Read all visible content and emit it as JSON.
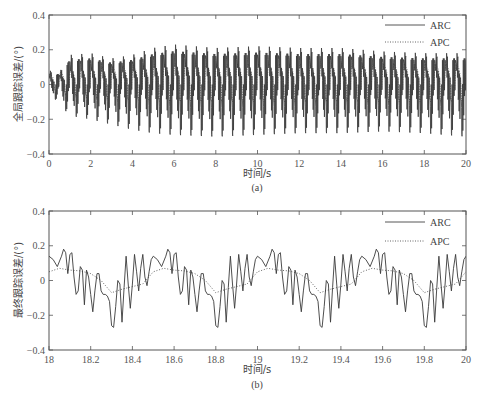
{
  "chart_data": [
    {
      "id": "a",
      "type": "line",
      "caption": "(a)",
      "ylabel": "全局跟踪误差/(°)",
      "xlabel": "时间/s",
      "xlim": [
        0,
        20
      ],
      "ylim": [
        -0.4,
        0.4
      ],
      "xticks": [
        0,
        2,
        4,
        6,
        8,
        10,
        12,
        14,
        16,
        18,
        20
      ],
      "xtick_labels": [
        "0",
        "2",
        "4",
        "6",
        "8",
        "10",
        "12",
        "14",
        "16",
        "18",
        "20"
      ],
      "yticks": [
        -0.4,
        -0.2,
        0,
        0.2,
        0.4
      ],
      "ytick_labels": [
        "-0.4",
        "-0.2",
        "0",
        "0.2",
        "0.4"
      ],
      "grid": false,
      "legend": {
        "position": "upper right",
        "entries": [
          {
            "name": "ARC",
            "style": "solid"
          },
          {
            "name": "APC",
            "style": "dotted"
          }
        ]
      },
      "series": [
        {
          "name": "ARC",
          "style": "solid",
          "description": "Dense oscillation, period ~0.5 s, each cycle containing high-frequency ripple",
          "period_s": 0.5,
          "envelope": {
            "t": [
              0,
              0.5,
              1,
              2,
              3,
              4,
              5,
              6,
              8,
              10,
              12,
              14,
              16,
              18,
              20
            ],
            "max": [
              0.08,
              0.07,
              0.17,
              0.18,
              0.15,
              0.17,
              0.21,
              0.23,
              0.21,
              0.22,
              0.21,
              0.21,
              0.19,
              0.18,
              0.18
            ],
            "min": [
              -0.05,
              -0.11,
              -0.18,
              -0.2,
              -0.23,
              -0.26,
              -0.28,
              -0.29,
              -0.3,
              -0.29,
              -0.28,
              -0.28,
              -0.27,
              -0.28,
              -0.3
            ]
          }
        },
        {
          "name": "APC",
          "style": "dotted",
          "description": "Smoother oscillation with same period, amplitude ~0.1",
          "period_s": 0.5,
          "envelope": {
            "t": [
              0,
              2,
              6,
              10,
              20
            ],
            "max": [
              0.06,
              0.1,
              0.12,
              0.12,
              0.12
            ],
            "min": [
              -0.05,
              -0.08,
              -0.1,
              -0.1,
              -0.1
            ]
          }
        }
      ]
    },
    {
      "id": "b",
      "type": "line",
      "caption": "(b)",
      "ylabel": "最终跟踪误差/(°)",
      "xlabel": "时间/s",
      "xlim": [
        18,
        20
      ],
      "ylim": [
        -0.4,
        0.4
      ],
      "xticks": [
        18,
        18.2,
        18.4,
        18.6,
        18.8,
        19,
        19.2,
        19.4,
        19.6,
        19.8,
        20
      ],
      "xtick_labels": [
        "18",
        "18.2",
        "18.4",
        "18.6",
        "18.8",
        "19",
        "19.2",
        "19.4",
        "19.6",
        "19.8",
        "20"
      ],
      "yticks": [
        -0.4,
        -0.2,
        0,
        0.2,
        0.4
      ],
      "ytick_labels": [
        "-0.4",
        "-0.2",
        "0",
        "0.2",
        "0.4"
      ],
      "grid": false,
      "legend": {
        "position": "upper right",
        "entries": [
          {
            "name": "ARC",
            "style": "solid"
          },
          {
            "name": "APC",
            "style": "dotted"
          }
        ]
      },
      "period_s": 0.5,
      "series": [
        {
          "name": "ARC",
          "style": "solid",
          "cycle_t_offset": [
            0,
            0.02,
            0.04,
            0.06,
            0.07,
            0.08,
            0.09,
            0.1,
            0.11,
            0.12,
            0.13,
            0.14,
            0.15,
            0.16,
            0.17,
            0.18,
            0.19,
            0.2,
            0.21,
            0.22,
            0.23,
            0.24,
            0.25,
            0.26,
            0.27,
            0.28,
            0.29,
            0.3,
            0.31,
            0.32,
            0.33,
            0.34,
            0.35,
            0.36,
            0.37,
            0.38,
            0.39,
            0.4,
            0.41,
            0.42,
            0.43,
            0.44,
            0.45,
            0.46,
            0.47,
            0.48,
            0.49
          ],
          "cycle_values": [
            0.14,
            0.12,
            0.08,
            0.14,
            0.18,
            0.16,
            0.04,
            0.15,
            0.16,
            0.02,
            -0.08,
            -0.06,
            0.08,
            0.06,
            -0.14,
            0.06,
            0.02,
            -0.08,
            -0.18,
            -0.06,
            0.04,
            0.04,
            -0.06,
            -0.08,
            -0.08,
            -0.09,
            -0.12,
            -0.26,
            -0.27,
            -0.15,
            0.0,
            -0.02,
            -0.24,
            -0.04,
            0.14,
            -0.02,
            -0.16,
            -0.02,
            0.15,
            0.05,
            -0.06,
            0.07,
            0.15,
            0.02,
            -0.03,
            0.05,
            0.12
          ]
        },
        {
          "name": "APC",
          "style": "dotted",
          "cycle_t_offset": [
            0,
            0.05,
            0.1,
            0.15,
            0.2,
            0.25,
            0.3,
            0.35,
            0.4,
            0.45,
            0.5
          ],
          "cycle_values": [
            0.05,
            0.07,
            0.06,
            0.055,
            0.04,
            0.0,
            -0.07,
            -0.05,
            -0.035,
            -0.02,
            0.05
          ]
        }
      ]
    }
  ],
  "panels": {
    "a": {
      "ylabel": "全局跟踪误差/(°)",
      "xlabel": "时间/s",
      "caption": "(a)",
      "legend_arc": "ARC",
      "legend_apc": "APC"
    },
    "b": {
      "ylabel": "最终跟踪误差/(°)",
      "xlabel": "时间/s",
      "caption": "(b)",
      "legend_arc": "ARC",
      "legend_apc": "APC"
    }
  },
  "colors": {
    "axis": "#555555",
    "arc": "#444444",
    "apc": "#555555",
    "text": "#555555"
  }
}
